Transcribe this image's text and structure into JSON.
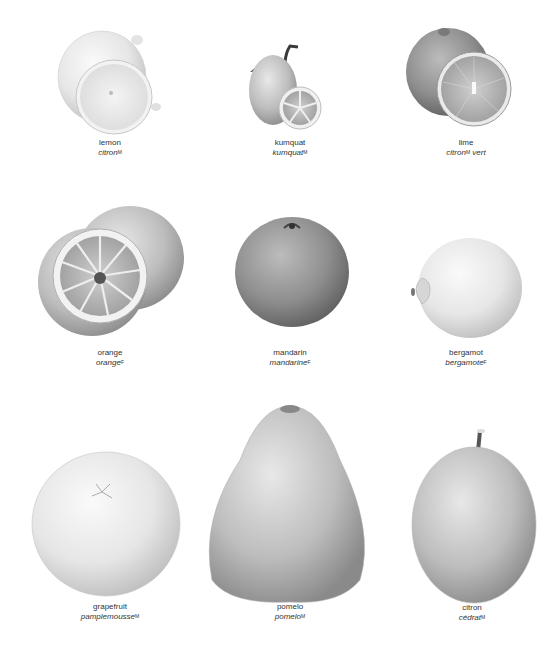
{
  "fruits": [
    {
      "id": "lemon",
      "en": "lemon",
      "fr": "citron",
      "gender": "M"
    },
    {
      "id": "kumquat",
      "en": "kumquat",
      "fr": "kumquat",
      "gender": "M"
    },
    {
      "id": "lime",
      "en": "lime",
      "fr": "citron",
      "gender": "M",
      "fr_suffix": " vert"
    },
    {
      "id": "orange",
      "en": "orange",
      "fr": "orange",
      "gender": "F"
    },
    {
      "id": "mandarin",
      "en": "mandarin",
      "fr": "mandarine",
      "gender": "F"
    },
    {
      "id": "bergamot",
      "en": "bergamot",
      "fr": "bergamote",
      "gender": "F"
    },
    {
      "id": "grapefruit",
      "en": "grapefruit",
      "fr": "pamplemousse",
      "gender": "M"
    },
    {
      "id": "pomelo",
      "en": "pomelo",
      "fr": "pomelo",
      "gender": "M"
    },
    {
      "id": "citron",
      "en": "citron",
      "fr": "cédrat",
      "gender": "M"
    }
  ]
}
